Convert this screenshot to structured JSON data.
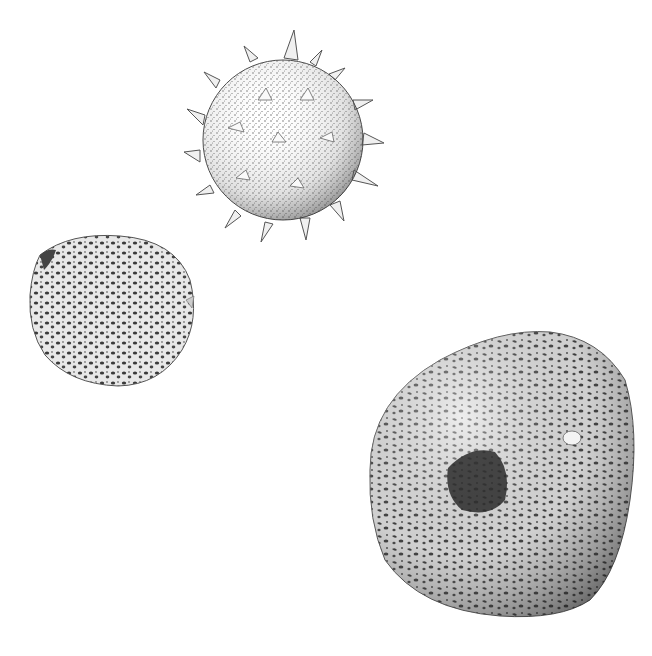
{
  "illustration": {
    "style": "stipple pen-and-ink scientific illustration",
    "background": "#ffffff",
    "ink_color": "#3a3a3a",
    "subjects": [
      {
        "name": "spiny-echinate-pollen-grain",
        "shape": "spherical with conical spines",
        "center": [
          283,
          138
        ],
        "radius": 82
      },
      {
        "name": "small-reticulate-pollen-grain",
        "shape": "rounded, reticulate (net-patterned) surface",
        "center": [
          110,
          310
        ],
        "radius": 78
      },
      {
        "name": "large-reticulate-pollen-grain",
        "shape": "ovoid/triangular, reticulate with dark central pore",
        "center": [
          500,
          470
        ],
        "radius": 140
      }
    ]
  }
}
